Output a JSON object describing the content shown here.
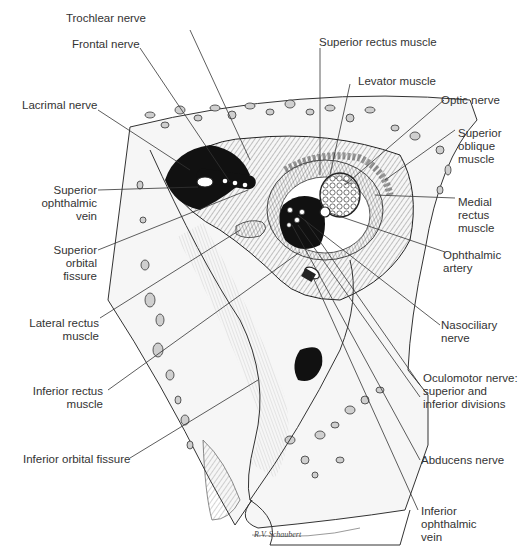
{
  "figure": {
    "signature": "R.V. Schaubert"
  },
  "labels": {
    "trochlear_nerve": "Trochlear nerve",
    "frontal_nerve": "Frontal nerve",
    "lacrimal_nerve": "Lacrimal nerve",
    "superior_ophthalmic_vein": "Superior\nophthalmic vein",
    "superior_orbital_fissure": "Superior orbital\nfissure",
    "lateral_rectus_muscle": "Lateral rectus\nmuscle",
    "inferior_rectus_muscle": "Inferior rectus\nmuscle",
    "inferior_orbital_fissure": "Inferior orbital fissure",
    "superior_rectus_muscle": "Superior rectus muscle",
    "levator_muscle": "Levator muscle",
    "optic_nerve": "Optic nerve",
    "superior_oblique_muscle": "Superior\noblique\nmuscle",
    "medial_rectus_muscle": "Medial\nrectus\nmuscle",
    "ophthalmic_artery": "Ophthalmic\nartery",
    "nasociliary_nerve": "Nasociliary\nnerve",
    "oculomotor_nerve": "Oculomotor nerve:\nsuperior and\ninferior divisions",
    "abducens_nerve": "Abducens nerve",
    "inferior_ophthalmic_vein": "Inferior\nophthalmic\nvein"
  },
  "colors": {
    "line": "#333333",
    "bone_fill": "#f4f4f4",
    "cavity": "#111111"
  }
}
